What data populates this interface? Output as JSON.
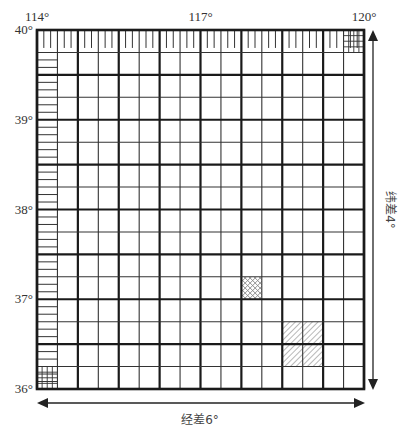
{
  "diagram": {
    "longitude_labels": [
      {
        "value": 114,
        "text": "114°"
      },
      {
        "value": 117,
        "text": "117°"
      },
      {
        "value": 120,
        "text": "120°"
      }
    ],
    "latitude_labels": [
      {
        "value": 40,
        "text": "40°"
      },
      {
        "value": 39,
        "text": "39°"
      },
      {
        "value": 38,
        "text": "38°"
      },
      {
        "value": 37,
        "text": "37°"
      },
      {
        "value": 36,
        "text": "36°"
      }
    ],
    "lon_range": [
      114,
      120
    ],
    "lat_range": [
      36,
      40
    ],
    "major_cols": 8,
    "major_rows": 8,
    "minor_per_major": 2,
    "fine_ticks_per_minor": 3,
    "longitude_span_label": "经差6°",
    "latitude_span_label": "纬差4°",
    "highlights": [
      {
        "type": "cross-hatch",
        "col": 10,
        "row": 11,
        "note": "single minor cell"
      },
      {
        "type": "diagonal-hatch",
        "col": 12,
        "row": 13,
        "span_cols": 2,
        "span_rows": 2,
        "note": "one major cell"
      }
    ],
    "colors": {
      "line": "#1a1a1a",
      "thin_line": "#333333",
      "hatch": "#888888",
      "arrow": "#222222"
    }
  }
}
